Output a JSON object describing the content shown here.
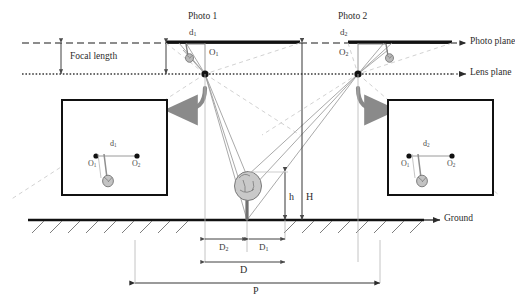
{
  "figure": {
    "type": "photogrammetry-stereo-diagram"
  },
  "titles": {
    "photo1": "Photo 1",
    "photo2": "Photo 2"
  },
  "planes": {
    "photo_plane": "Photo plane",
    "lens_plane": "Lens plane",
    "ground": "Ground"
  },
  "measures": {
    "focal_length": "Focal length",
    "H": "H",
    "h": "h",
    "D": "D",
    "D1_letter": "D",
    "D1_sub": "1",
    "D2_letter": "D",
    "D2_sub": "2",
    "P": "P"
  },
  "photo_symbols": {
    "d1_letter": "d",
    "d1_sub": "1",
    "d2_letter": "d",
    "d2_sub": "2",
    "O1_letter": "O",
    "O1_sub": "1",
    "O2_letter": "O",
    "O2_sub": "2"
  },
  "inset_left": {
    "d_letter": "d",
    "d_sub": "1",
    "O1_letter": "O",
    "O1_sub": "1",
    "O2_letter": "O",
    "O2_sub": "2"
  },
  "inset_right": {
    "d_letter": "d",
    "d_sub": "2",
    "O1_letter": "O",
    "O1_sub": "1",
    "O2_letter": "O",
    "O2_sub": "2"
  },
  "colors": {
    "ink": "#1a1a1a",
    "ray": "#8c8c8c",
    "faint": "#c6c6c6",
    "arrow": "#808080",
    "tree": "#9a9a9a"
  },
  "geometry": {
    "photo_plane_y": 43,
    "lens_plane_y": 74,
    "ground_y": 220,
    "lens1_x": 205,
    "lens2_x": 358,
    "tree_base_x": 247,
    "tree_top_y": 172
  }
}
